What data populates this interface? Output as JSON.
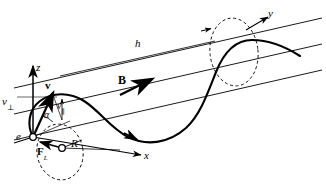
{
  "figure": {
    "caption_present": false,
    "background_color": "#ffffff",
    "stroke_color": "#000000",
    "width": 326,
    "height": 187
  },
  "axes": {
    "z": {
      "label": "z",
      "x": 36,
      "y": 63,
      "style": "italic"
    },
    "x": {
      "label": "x",
      "x": 144,
      "y": 157,
      "style": "italic"
    },
    "y": {
      "label": "y",
      "x": 268,
      "y": 11,
      "style": "italic"
    }
  },
  "labels": {
    "charge": {
      "text": "e",
      "x": 16,
      "y": 134,
      "style": "italic"
    },
    "velocity": {
      "text": "v",
      "x": 45,
      "y": 82,
      "style": "bold"
    },
    "velocity_perp": {
      "text": "v",
      "sub": "⊥",
      "x": 3,
      "y": 100,
      "style": "italic"
    },
    "velocity_par": {
      "text": "v",
      "sub": "∥",
      "x": 57,
      "y": 104,
      "style": "italic"
    },
    "pitch_angle": {
      "text": "α",
      "x": 44,
      "y": 112,
      "style": "italic"
    },
    "magnetic_field": {
      "text": "B",
      "x": 119,
      "y": 76,
      "style": "bold"
    },
    "pitch_height": {
      "text": "h",
      "x": 135,
      "y": 41,
      "style": "italic"
    },
    "lorentz_force": {
      "text": "F",
      "sub": "L",
      "x": 38,
      "y": 148,
      "style": "bold"
    },
    "gyroradius": {
      "text": "R",
      "x": 72,
      "y": 142,
      "style": "italic"
    }
  },
  "geometry": {
    "field_lines": [
      {
        "name": "upper-field-line",
        "x1": 14,
        "y1": 87,
        "x2": 322,
        "y2": 18,
        "arrow": true
      },
      {
        "name": "middle-field-line",
        "x1": 14,
        "y1": 113,
        "x2": 322,
        "y2": 44,
        "arrow": false
      },
      {
        "name": "lower-field-line",
        "x1": 14,
        "y1": 139,
        "x2": 322,
        "y2": 70,
        "arrow": false
      }
    ],
    "gyro_circles": [
      {
        "name": "start-gyro-circle",
        "cx": 60,
        "cy": 152,
        "rx": 24,
        "ry": 29,
        "rotation": -12,
        "dashed": true
      },
      {
        "name": "end-gyro-circle",
        "cx": 234,
        "cy": 52,
        "rx": 25,
        "ry": 35,
        "rotation": -8,
        "dashed": true
      }
    ],
    "particle_markers": [
      {
        "name": "particle-at-origin",
        "cx": 33,
        "cy": 137
      },
      {
        "name": "particle-on-circle",
        "cx": 62,
        "cy": 148
      }
    ]
  },
  "colors": {
    "ink": "#000000",
    "paper": "#ffffff",
    "thin_line": "#1a1a1a"
  }
}
